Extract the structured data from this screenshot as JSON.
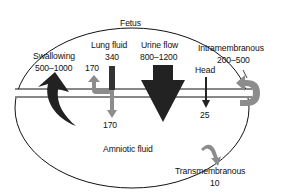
{
  "diagram": {
    "compartments": {
      "top": "Fetus",
      "bottom": "Amniotic fluid"
    },
    "flows": [
      {
        "name": "Swallowing",
        "value": "500–1000",
        "direction": "amniotic-to-fetus"
      },
      {
        "name": "Lung fluid",
        "value": "340",
        "split": [
          "170",
          "170"
        ],
        "direction": "fetus-to-amniotic"
      },
      {
        "name": "Urine flow",
        "value": "800–1200",
        "direction": "fetus-to-amniotic"
      },
      {
        "name": "Head",
        "value": "25",
        "direction": "fetus-to-amniotic"
      },
      {
        "name": "Intramembranous",
        "value": "200–500",
        "direction": "amniotic-to-fetus"
      },
      {
        "name": "Transmembranous",
        "value": "10",
        "direction": "amniotic-to-maternal"
      }
    ],
    "colors": {
      "dark_arrow": "#222222",
      "gray_arrow": "#8c8c8c",
      "line": "#111111"
    }
  }
}
